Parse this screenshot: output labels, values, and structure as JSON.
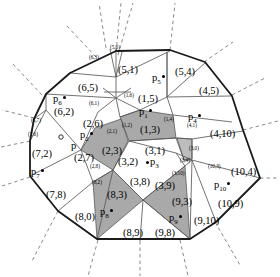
{
  "figure": {
    "type": "voronoi-cell-decomposition-diagram",
    "colors": {
      "background": "#ffffff",
      "outline": "#1a1a1a",
      "interior_line": "#555555",
      "dashed_ray": "#8a8a8a",
      "shade_gray": "#a9a9a9",
      "shade_gray_light": "#bdbdbd",
      "text": "#000000"
    }
  },
  "cell_labels": [
    {
      "id": "c-5-1",
      "text": "(5,1)",
      "x": 118,
      "y": 64
    },
    {
      "id": "c-5-4",
      "text": "(5,4)",
      "x": 175,
      "y": 66
    },
    {
      "id": "c-4-5",
      "text": "(4,5)",
      "x": 199,
      "y": 85
    },
    {
      "id": "c-6-5",
      "text": "(6,5)",
      "x": 78,
      "y": 82
    },
    {
      "id": "c-1-5",
      "text": "(1,5)",
      "x": 138,
      "y": 93
    },
    {
      "id": "c-6-2",
      "text": "(6,2)",
      "x": 54,
      "y": 106
    },
    {
      "id": "c-2-6",
      "text": "(2,6)",
      "x": 83,
      "y": 118
    },
    {
      "id": "c-1-3",
      "text": "(1,3)",
      "x": 140,
      "y": 124
    },
    {
      "id": "c-4-10",
      "text": "(4,10)",
      "x": 210,
      "y": 128
    },
    {
      "id": "c-7-2",
      "text": "(7,2)",
      "x": 32,
      "y": 148
    },
    {
      "id": "c-2-7",
      "text": "(2,7)",
      "x": 74,
      "y": 152
    },
    {
      "id": "c-2-3",
      "text": "(2,3)",
      "x": 102,
      "y": 145
    },
    {
      "id": "c-3-1",
      "text": "(3,1)",
      "x": 145,
      "y": 145
    },
    {
      "id": "c-3-2",
      "text": "(3,2)",
      "x": 118,
      "y": 156
    },
    {
      "id": "c-10-4",
      "text": "(10,4)",
      "x": 231,
      "y": 166
    },
    {
      "id": "c-3-8",
      "text": "(3,8)",
      "x": 130,
      "y": 176
    },
    {
      "id": "c-3-9",
      "text": "(3,9)",
      "x": 155,
      "y": 180
    },
    {
      "id": "c-7-8",
      "text": "(7,8)",
      "x": 46,
      "y": 189
    },
    {
      "id": "c-8-3",
      "text": "(8,3)",
      "x": 107,
      "y": 189
    },
    {
      "id": "c-9-3",
      "text": "(9,3)",
      "x": 172,
      "y": 196
    },
    {
      "id": "c-10-9",
      "text": "(10,9)",
      "x": 218,
      "y": 198
    },
    {
      "id": "c-8-0",
      "text": "(8,0)",
      "x": 75,
      "y": 211
    },
    {
      "id": "c-9-10",
      "text": "(9,10)",
      "x": 194,
      "y": 215
    },
    {
      "id": "c-8-9",
      "text": "(8,9)",
      "x": 123,
      "y": 227
    },
    {
      "id": "c-9-8",
      "text": "(9,8)",
      "x": 155,
      "y": 227
    }
  ],
  "point_labels": [
    {
      "id": "p6",
      "base": "p",
      "sub": "6",
      "x": 53,
      "y": 93,
      "dot": true
    },
    {
      "id": "p5",
      "base": "p",
      "sub": "5",
      "x": 152,
      "y": 72,
      "dot": true
    },
    {
      "id": "p1",
      "base": "p",
      "sub": "1",
      "x": 139,
      "y": 106,
      "dot": true
    },
    {
      "id": "p4",
      "base": "p",
      "sub": "4",
      "x": 188,
      "y": 111,
      "dot": true
    },
    {
      "id": "p2",
      "base": "p",
      "sub": "2",
      "x": 80,
      "y": 129,
      "dot": true
    },
    {
      "id": "p",
      "base": "p",
      "sub": "",
      "x": 66,
      "y": 140,
      "dot": false,
      "open_circle": true
    },
    {
      "id": "p3",
      "base": "p",
      "sub": "3",
      "x": 146,
      "y": 156,
      "dot": false,
      "dot_before": true
    },
    {
      "id": "p7",
      "base": "p",
      "sub": "7",
      "x": 31,
      "y": 166,
      "dot": true
    },
    {
      "id": "p10",
      "base": "p",
      "sub": "10",
      "x": 214,
      "y": 179,
      "dot": true
    },
    {
      "id": "p8",
      "base": "p",
      "sub": "8",
      "x": 100,
      "y": 206,
      "dot": true
    },
    {
      "id": "p9",
      "base": "p",
      "sub": "9",
      "x": 169,
      "y": 212,
      "dot": true
    }
  ],
  "edge_labels": [
    {
      "id": "e-6-3",
      "text": "(6,3)",
      "x": 89,
      "y": 54
    },
    {
      "id": "e-5-6",
      "text": "(5,6)",
      "x": 110,
      "y": 44
    },
    {
      "id": "e-6-1",
      "text": "(6,1)",
      "x": 89,
      "y": 100
    },
    {
      "id": "e-1-6",
      "text": "(1,6)",
      "x": 124,
      "y": 92
    },
    {
      "id": "e-1-2",
      "text": "(1,2)",
      "x": 122,
      "y": 122
    },
    {
      "id": "e-2-1",
      "text": "(2,1)",
      "x": 107,
      "y": 128
    },
    {
      "id": "e-1-4",
      "text": "(1,4)",
      "x": 164,
      "y": 116
    },
    {
      "id": "e-4-1",
      "text": "(4,1)",
      "x": 187,
      "y": 122
    },
    {
      "id": "e-6-7",
      "text": "(6,7)",
      "x": 31,
      "y": 117
    },
    {
      "id": "e-7-6",
      "text": "(7,6)",
      "x": 28,
      "y": 131
    },
    {
      "id": "e-2-8",
      "text": "(2,8)",
      "x": 90,
      "y": 163
    },
    {
      "id": "e-8-2",
      "text": "(8,2)",
      "x": 92,
      "y": 179
    },
    {
      "id": "e-3-0",
      "text": "(3,0)",
      "x": 189,
      "y": 145
    },
    {
      "id": "e-3-4",
      "text": "(3,4)",
      "x": 180,
      "y": 157
    },
    {
      "id": "e-3-10",
      "text": "(3,10)",
      "x": 172,
      "y": 170
    },
    {
      "id": "e-10-3",
      "text": "(10,3)",
      "x": 208,
      "y": 163
    }
  ]
}
